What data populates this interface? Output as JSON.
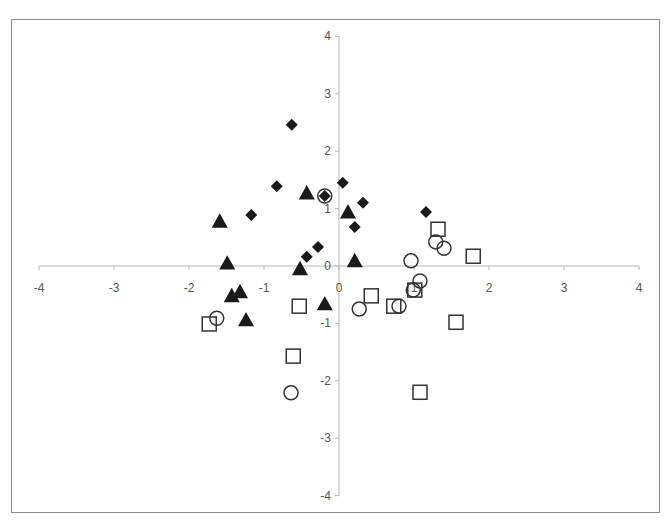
{
  "chart_data": {
    "type": "scatter",
    "title": "",
    "xlabel": "",
    "ylabel": "",
    "xlim": [
      -4,
      4
    ],
    "ylim": [
      -4,
      4
    ],
    "x_ticks": [
      -4,
      -3,
      -2,
      -1,
      0,
      1,
      2,
      3,
      4
    ],
    "y_ticks": [
      -4,
      -3,
      -2,
      -1,
      0,
      1,
      2,
      3,
      4
    ],
    "grid": false,
    "legend": null,
    "axes_cross_at_origin": true,
    "series": [
      {
        "name": "Series 1",
        "marker": "diamond",
        "filled": true,
        "color": "#1a1a1a",
        "points": [
          [
            -0.63,
            2.46
          ],
          [
            -0.83,
            1.39
          ],
          [
            0.05,
            1.45
          ],
          [
            -1.17,
            0.89
          ],
          [
            0.32,
            1.1
          ],
          [
            1.16,
            0.94
          ],
          [
            0.21,
            0.68
          ],
          [
            -0.28,
            0.33
          ],
          [
            -0.43,
            0.16
          ],
          [
            -0.19,
            1.22
          ]
        ]
      },
      {
        "name": "Series 2",
        "marker": "triangle",
        "filled": true,
        "color": "#1a1a1a",
        "points": [
          [
            -0.43,
            1.27
          ],
          [
            0.12,
            0.94
          ],
          [
            -1.59,
            0.78
          ],
          [
            -1.49,
            0.05
          ],
          [
            0.21,
            0.09
          ],
          [
            -0.52,
            -0.05
          ],
          [
            -1.32,
            -0.45
          ],
          [
            -1.43,
            -0.52
          ],
          [
            -1.24,
            -0.94
          ],
          [
            -0.19,
            -0.66
          ]
        ]
      },
      {
        "name": "Series 3",
        "marker": "circle",
        "filled": false,
        "color": "#333333",
        "points": [
          [
            -0.19,
            1.22
          ],
          [
            0.96,
            0.09
          ],
          [
            1.29,
            0.42
          ],
          [
            1.4,
            0.31
          ],
          [
            1.08,
            -0.26
          ],
          [
            0.99,
            -0.42
          ],
          [
            0.8,
            -0.7
          ],
          [
            0.27,
            -0.75
          ],
          [
            -1.63,
            -0.91
          ],
          [
            -0.64,
            -2.21
          ]
        ]
      },
      {
        "name": "Series 4",
        "marker": "square",
        "filled": false,
        "color": "#333333",
        "points": [
          [
            1.32,
            0.64
          ],
          [
            1.79,
            0.17
          ],
          [
            0.43,
            -0.52
          ],
          [
            -0.53,
            -0.7
          ],
          [
            0.73,
            -0.7
          ],
          [
            1.01,
            -0.42
          ],
          [
            1.56,
            -0.98
          ],
          [
            -1.73,
            -1.01
          ],
          [
            -0.61,
            -1.57
          ],
          [
            1.08,
            -2.2
          ]
        ]
      }
    ]
  }
}
